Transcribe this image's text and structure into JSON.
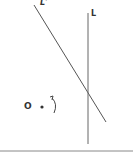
{
  "diagram": {
    "labels": {
      "line_l_prime": "L'",
      "line_l": "L",
      "point_o": "O"
    },
    "colors": {
      "stroke": "#555555",
      "text": "#333333",
      "baseline": "#777777"
    }
  }
}
